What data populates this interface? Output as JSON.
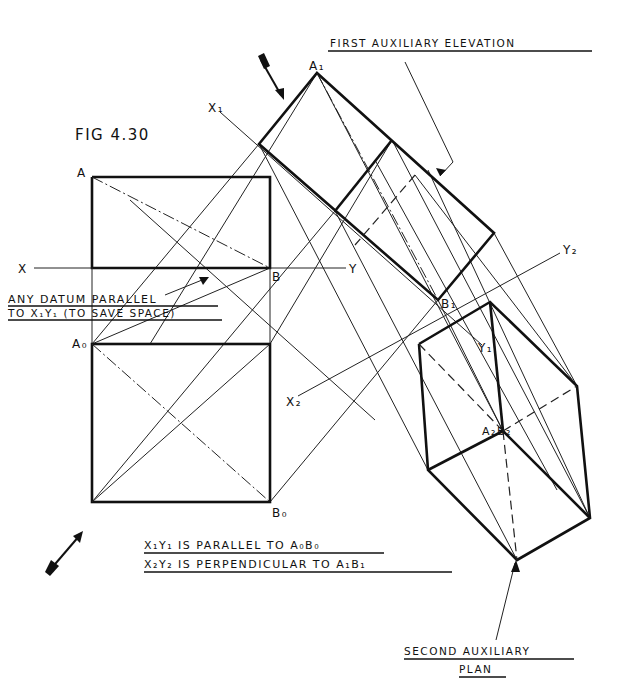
{
  "figure": {
    "title": "FIG 4.30",
    "labels": {
      "first_aux_elevation": "FIRST AUXILIARY ELEVATION",
      "second_aux_plan_line1": "SECOND AUXILIARY",
      "second_aux_plan_line2": "PLAN",
      "datum_note_line1": "ANY DATUM PARALLEL",
      "datum_note_line2": "TO X₁Y₁ (TO SAVE SPACE)",
      "note1": "X₁Y₁ IS PARALLEL TO A₀B₀",
      "note2": "X₂Y₂ IS PERPENDICULAR TO A₁B₁"
    },
    "points": {
      "A": "A",
      "B": "B",
      "A0": "A₀",
      "B0": "B₀",
      "A1": "A₁",
      "B1": "B₁",
      "A2B2": "A₂B₂"
    },
    "axes": {
      "X": "X",
      "Y": "Y",
      "X1": "X₁",
      "Y1": "Y₁",
      "X2": "X₂",
      "Y2": "Y₂"
    },
    "icons": {
      "view_arrow_top": "viewing-direction-arrow",
      "view_arrow_bottom": "viewing-direction-arrow"
    },
    "colors": {
      "ink": "#111111",
      "paper": "#ffffff"
    }
  }
}
